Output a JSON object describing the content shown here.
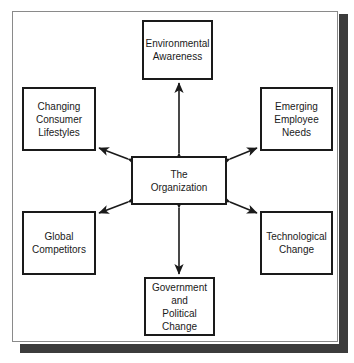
{
  "figure": {
    "frame_color": "#8a8a8a",
    "shadow_color": "#3c3c3c",
    "box_border_color": "#1a1a1a",
    "text_color": "#1a1a1a",
    "background_color": "#ffffff"
  },
  "nodes": {
    "center": {
      "label": "The\nOrganization"
    },
    "top": {
      "label": "Environmental\nAwareness"
    },
    "bottom": {
      "label": "Government\nand\nPolitical\nChange"
    },
    "top_left": {
      "label": "Changing\nConsumer\nLifestyles"
    },
    "bottom_left": {
      "label": "Global\nCompetitors"
    },
    "top_right": {
      "label": "Emerging\nEmployee\nNeeds"
    },
    "bottom_right": {
      "label": "Technological\nChange"
    }
  },
  "connectors": [
    {
      "name": "center-to-top",
      "style": "double-headed-arrow",
      "orientation": "vertical"
    },
    {
      "name": "center-to-bottom",
      "style": "double-headed-arrow",
      "orientation": "vertical"
    },
    {
      "name": "center-to-top-left",
      "style": "double-headed-arrow",
      "orientation": "diagonal"
    },
    {
      "name": "center-to-bottom-left",
      "style": "double-headed-arrow",
      "orientation": "diagonal"
    },
    {
      "name": "center-to-top-right",
      "style": "double-headed-arrow",
      "orientation": "diagonal"
    },
    {
      "name": "center-to-bottom-right",
      "style": "double-headed-arrow",
      "orientation": "diagonal"
    }
  ]
}
